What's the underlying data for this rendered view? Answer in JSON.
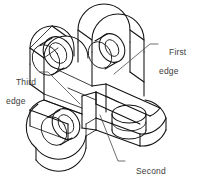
{
  "drawing": {
    "type": "isometric-technical-drawing",
    "subject": "three-armed bracket with cylindrical bosses",
    "background_color": "#ffffff",
    "line_color": "#111111",
    "leader_color": "#4a4a4a",
    "text_color": "#3d3d3d"
  },
  "callouts": [
    {
      "id": "first",
      "line1": "First",
      "line2": "edge",
      "position": "upper-right",
      "leader_target": "vertical edge on right arm near top"
    },
    {
      "id": "third",
      "line1": "Third",
      "line2": "edge",
      "position": "left",
      "leader_target": "vertical edge on left arm mid-height"
    },
    {
      "id": "second",
      "line1": "Second",
      "line2": "edge",
      "position": "lower-center-right",
      "leader_target": "interior vertical edge at central intersection"
    }
  ]
}
